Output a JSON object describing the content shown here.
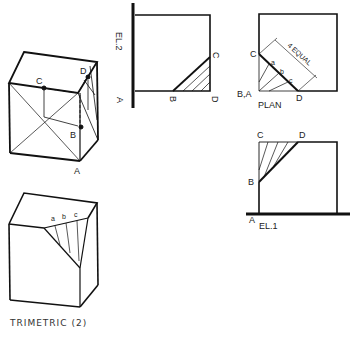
{
  "views": {
    "el2": {
      "title": "EL.2",
      "points": {
        "A": "A",
        "B": "B",
        "C": "C",
        "D": "D"
      }
    },
    "plan": {
      "title": "PLAN",
      "points": {
        "C": "C",
        "BA": "B,A",
        "D": "D",
        "a": "a",
        "b": "b",
        "c": "c"
      },
      "dimension": "4 EQUAL"
    },
    "el1": {
      "title": "EL.1",
      "points": {
        "A": "A",
        "B": "B",
        "C": "C",
        "D": "D"
      }
    },
    "trimetric1": {
      "points": {
        "A": "A",
        "B": "B",
        "C": "C",
        "D": "D"
      }
    },
    "trimetric2": {
      "points": {
        "a": "a",
        "b": "b",
        "c": "c"
      }
    }
  },
  "caption": "TRIMETRIC (2)"
}
